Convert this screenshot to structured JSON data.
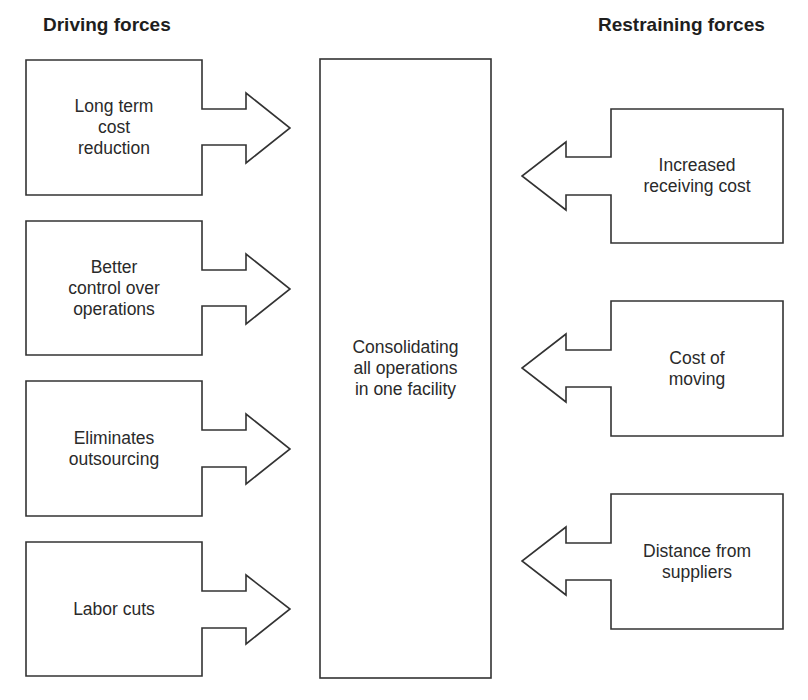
{
  "title_left": "Driving forces",
  "title_right": "Restraining forces",
  "center": {
    "label": "Consolidating\nall operations\nin one facility"
  },
  "driving_forces": [
    {
      "label": "Long term\ncost\nreduction"
    },
    {
      "label": "Better\ncontrol over\noperations"
    },
    {
      "label": "Eliminates\noutsourcing"
    },
    {
      "label": "Labor cuts"
    }
  ],
  "restraining_forces": [
    {
      "label": "Increased\nreceiving cost"
    },
    {
      "label": "Cost of\nmoving"
    },
    {
      "label": "Distance from\nsuppliers"
    }
  ],
  "colors": {
    "stroke": "#333333",
    "text": "#222222",
    "background": "#ffffff"
  }
}
